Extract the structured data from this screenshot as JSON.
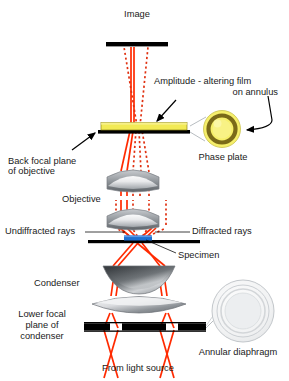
{
  "figure": {
    "background_color": "#ffffff"
  },
  "colors": {
    "ray_undiffracted": "#ff2a00",
    "ray_diffracted": "#e03010",
    "phase_plate_film": "#f2ea55",
    "phase_plate_ring": "#7a6a18",
    "phase_plate_disc": "#f6ef6a",
    "bar_black": "#000000",
    "lens_gray_light": "#e9eaec",
    "lens_gray_dark": "#5b5f63",
    "specimen_blue": "#1f6fd0",
    "diaphragm_outline": "#b9bdc2",
    "text": "#1a1a1a",
    "leader_line": "#9aa0a6",
    "arrow": "#000000"
  },
  "labels": {
    "image": "Image",
    "amplitude_film_line1": "Amplitude - altering film",
    "amplitude_film_line2": "on annulus",
    "phase_plate": "Phase plate",
    "back_focal_line1": "Back focal plane",
    "back_focal_line2": "of objective",
    "objective": "Objective",
    "undiffracted_rays": "Undiffracted rays",
    "diffracted_rays": "Diffracted rays",
    "specimen": "Specimen",
    "condenser": "Condenser",
    "lower_focal_line1": "Lower focal",
    "lower_focal_line2": "plane of",
    "lower_focal_line3": "condenser",
    "annular_diaphragm": "Annular diaphragm",
    "from_light_source": "From light source"
  },
  "components": [
    {
      "name": "image-plane-bar",
      "type": "bar",
      "label": "Image"
    },
    {
      "name": "phase-plate-bar",
      "type": "bar-with-film",
      "label": "Back focal plane of objective"
    },
    {
      "name": "objective-lens-upper",
      "type": "lens",
      "label": "Objective"
    },
    {
      "name": "objective-lens-lower",
      "type": "lens",
      "label": "Objective"
    },
    {
      "name": "specimen-slide-bar",
      "type": "bar",
      "label": "Specimen"
    },
    {
      "name": "condenser-lens-upper",
      "type": "lens",
      "label": "Condenser"
    },
    {
      "name": "condenser-lens-lower",
      "type": "lens",
      "label": "Condenser"
    },
    {
      "name": "annular-diaphragm-bar",
      "type": "bar",
      "label": "Lower focal plane of condenser"
    }
  ],
  "ray_types": [
    {
      "name": "undiffracted",
      "style": "solid",
      "color": "#ff2a00"
    },
    {
      "name": "diffracted",
      "style": "dotted",
      "color": "#e03010"
    }
  ]
}
